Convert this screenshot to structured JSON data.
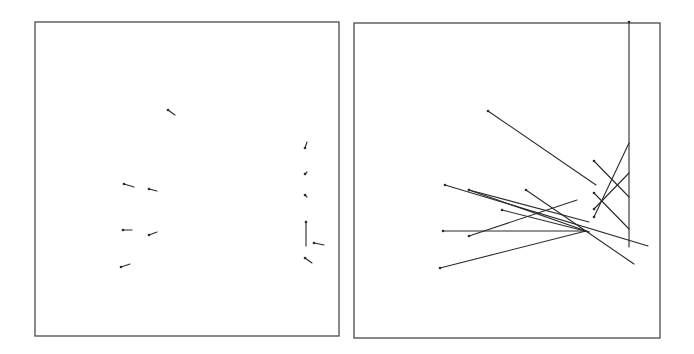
{
  "figure": {
    "width": 694,
    "height": 354,
    "stroke_color": "#2a2a2a",
    "frame_color": "#4a4a4a"
  },
  "panels": [
    {
      "id": "left",
      "name": "left-panel",
      "frame": {
        "x": 35,
        "y": 22,
        "w": 304,
        "h": 314
      },
      "segments": [
        [
          168,
          110,
          175,
          115
        ],
        [
          124,
          184,
          134,
          187
        ],
        [
          149,
          189,
          157,
          191
        ],
        [
          123,
          230,
          132,
          230
        ],
        [
          149,
          235,
          157,
          232
        ],
        [
          121,
          267,
          130,
          264
        ],
        [
          305,
          148,
          307,
          142
        ],
        [
          305,
          174,
          307,
          172
        ],
        [
          305,
          195,
          307,
          197
        ],
        [
          306,
          222,
          306,
          246
        ],
        [
          314,
          243,
          324,
          245
        ],
        [
          305,
          258,
          312,
          263
        ]
      ]
    },
    {
      "id": "right",
      "name": "right-panel",
      "frame": {
        "x": 354,
        "y": 23,
        "w": 306,
        "h": 315
      },
      "segments": [
        [
          488,
          111,
          596,
          185
        ],
        [
          445,
          185,
          648,
          246
        ],
        [
          469,
          190,
          589,
          232
        ],
        [
          469,
          190,
          589,
          222
        ],
        [
          502,
          210,
          589,
          232
        ],
        [
          526,
          190,
          634,
          264
        ],
        [
          443,
          231,
          586,
          231
        ],
        [
          469,
          236,
          577,
          200
        ],
        [
          440,
          268,
          586,
          231
        ],
        [
          594,
          161,
          629,
          197
        ],
        [
          594,
          193,
          629,
          229
        ],
        [
          594,
          217,
          629,
          143
        ],
        [
          594,
          209,
          629,
          173
        ],
        [
          629,
          22,
          629,
          247
        ]
      ]
    }
  ]
}
